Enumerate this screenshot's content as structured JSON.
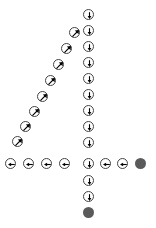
{
  "diagram": {
    "shape_description": "digit-four path composed of directional arrow markers",
    "canvas": {
      "width": 156,
      "height": 228,
      "background": "#ffffff"
    },
    "styles": {
      "open_marker_stroke": "#444444",
      "open_marker_fill": "#ffffff",
      "filled_marker_fill": "#5a5a5a",
      "arrow_color": "#000000",
      "marker_diameter": 11
    },
    "icon_names": {
      "down": "arrow-down-icon",
      "left": "arrow-left-icon",
      "up_right": "arrow-up-right-icon",
      "endpoint": "filled-endpoint-dot"
    },
    "segments": [
      {
        "name": "vertical-stem",
        "direction": "down",
        "label": "down",
        "count": 13
      },
      {
        "name": "diagonal-stroke",
        "direction": "up-right",
        "label": "up-right",
        "count": 8
      },
      {
        "name": "horizontal-bar",
        "direction": "left",
        "label": "left",
        "count": 6
      },
      {
        "name": "endpoints",
        "direction": "none",
        "label": "endpoint",
        "count": 2
      }
    ],
    "markers": [
      {
        "id": "v1",
        "x": 88,
        "y": 14,
        "kind": "open",
        "dir": "down",
        "icon": "arrow-down-icon"
      },
      {
        "id": "v2",
        "x": 88,
        "y": 30,
        "kind": "open",
        "dir": "down",
        "icon": "arrow-down-icon"
      },
      {
        "id": "v3",
        "x": 88,
        "y": 46,
        "kind": "open",
        "dir": "down",
        "icon": "arrow-down-icon"
      },
      {
        "id": "v4",
        "x": 88,
        "y": 62,
        "kind": "open",
        "dir": "down",
        "icon": "arrow-down-icon"
      },
      {
        "id": "v5",
        "x": 88,
        "y": 78,
        "kind": "open",
        "dir": "down",
        "icon": "arrow-down-icon"
      },
      {
        "id": "v6",
        "x": 88,
        "y": 94,
        "kind": "open",
        "dir": "down",
        "icon": "arrow-down-icon"
      },
      {
        "id": "v7",
        "x": 88,
        "y": 110,
        "kind": "open",
        "dir": "down",
        "icon": "arrow-down-icon"
      },
      {
        "id": "v8",
        "x": 88,
        "y": 126,
        "kind": "open",
        "dir": "down",
        "icon": "arrow-down-icon"
      },
      {
        "id": "v9",
        "x": 88,
        "y": 142,
        "kind": "open",
        "dir": "down",
        "icon": "arrow-down-icon"
      },
      {
        "id": "v10",
        "x": 88,
        "y": 163,
        "kind": "open",
        "dir": "down",
        "icon": "arrow-down-icon"
      },
      {
        "id": "v11",
        "x": 88,
        "y": 180,
        "kind": "open",
        "dir": "down",
        "icon": "arrow-down-icon"
      },
      {
        "id": "v12",
        "x": 88,
        "y": 196,
        "kind": "open",
        "dir": "down",
        "icon": "arrow-down-icon"
      },
      {
        "id": "v13",
        "x": 88,
        "y": 212,
        "kind": "filled",
        "dir": "none",
        "icon": "filled-endpoint-dot"
      },
      {
        "id": "d1",
        "x": 17,
        "y": 141,
        "kind": "open",
        "dir": "up-right",
        "icon": "arrow-up-right-icon"
      },
      {
        "id": "d2",
        "x": 25,
        "y": 126,
        "kind": "open",
        "dir": "up-right",
        "icon": "arrow-up-right-icon"
      },
      {
        "id": "d3",
        "x": 34,
        "y": 111,
        "kind": "open",
        "dir": "up-right",
        "icon": "arrow-up-right-icon"
      },
      {
        "id": "d4",
        "x": 42,
        "y": 96,
        "kind": "open",
        "dir": "up-right",
        "icon": "arrow-up-right-icon"
      },
      {
        "id": "d5",
        "x": 50,
        "y": 80,
        "kind": "open",
        "dir": "up-right",
        "icon": "arrow-up-right-icon"
      },
      {
        "id": "d6",
        "x": 58,
        "y": 64,
        "kind": "open",
        "dir": "up-right",
        "icon": "arrow-up-right-icon"
      },
      {
        "id": "d7",
        "x": 66,
        "y": 48,
        "kind": "open",
        "dir": "up-right",
        "icon": "arrow-up-right-icon"
      },
      {
        "id": "d8",
        "x": 74,
        "y": 32,
        "kind": "open",
        "dir": "up-right",
        "icon": "arrow-up-right-icon"
      },
      {
        "id": "h1",
        "x": 10,
        "y": 163,
        "kind": "open",
        "dir": "left",
        "icon": "arrow-left-icon"
      },
      {
        "id": "h2",
        "x": 28,
        "y": 163,
        "kind": "open",
        "dir": "left",
        "icon": "arrow-left-icon"
      },
      {
        "id": "h3",
        "x": 46,
        "y": 163,
        "kind": "open",
        "dir": "left",
        "icon": "arrow-left-icon"
      },
      {
        "id": "h4",
        "x": 64,
        "y": 163,
        "kind": "open",
        "dir": "left",
        "icon": "arrow-left-icon"
      },
      {
        "id": "h5",
        "x": 105,
        "y": 163,
        "kind": "open",
        "dir": "left",
        "icon": "arrow-left-icon"
      },
      {
        "id": "h6",
        "x": 122,
        "y": 163,
        "kind": "open",
        "dir": "left",
        "icon": "arrow-left-icon"
      },
      {
        "id": "h7",
        "x": 140,
        "y": 163,
        "kind": "filled",
        "dir": "none",
        "icon": "filled-endpoint-dot"
      }
    ]
  }
}
